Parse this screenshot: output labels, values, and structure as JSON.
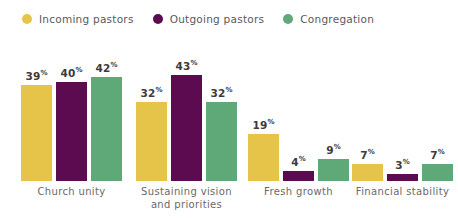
{
  "legend": {
    "position": "top-left",
    "items": [
      {
        "label": "Incoming pastors",
        "color": "#E6C44A",
        "marker": "legend-dot-incoming"
      },
      {
        "label": "Outgoing pastors",
        "color": "#5C0B50",
        "marker": "legend-dot-outgoing"
      },
      {
        "label": "Congregation",
        "color": "#5FA878",
        "marker": "legend-dot-congregation"
      }
    ]
  },
  "chart_data": {
    "type": "bar",
    "title": "",
    "subtitle": "",
    "xlabel": "",
    "ylabel": "",
    "ylim": [
      0,
      45
    ],
    "grid": false,
    "value_suffix": "%",
    "legend_position": "top-left",
    "categories": [
      "Church unity",
      "Sustaining vision and priorities",
      "Fresh growth",
      "Financial stability"
    ],
    "category_lines": [
      [
        "Church unity"
      ],
      [
        "Sustaining vision",
        "and priorities"
      ],
      [
        "Fresh growth"
      ],
      [
        "Financial stability"
      ]
    ],
    "series": [
      {
        "name": "Incoming pastors",
        "color": "#E6C44A",
        "values": [
          39,
          32,
          19,
          7
        ]
      },
      {
        "name": "Outgoing pastors",
        "color": "#5C0B50",
        "values": [
          40,
          43,
          4,
          3
        ]
      },
      {
        "name": "Congregation",
        "color": "#5FA878",
        "values": [
          42,
          32,
          9,
          7
        ]
      }
    ]
  },
  "colors": {
    "background": "#ffffff",
    "value_label": "#3b3b3b",
    "category_label": "#6a6a6a",
    "legend_label": "#5a5a5a",
    "incoming": "#E6C44A",
    "outgoing": "#5C0B50",
    "congregation": "#5FA878"
  }
}
